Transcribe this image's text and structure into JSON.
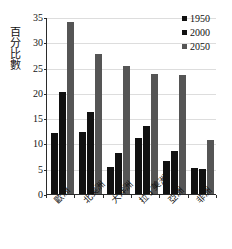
{
  "chart_data": {
    "type": "bar",
    "title": "",
    "xlabel": "",
    "ylabel": "百分比數",
    "ylim": [
      0,
      35
    ],
    "yticks": [
      0,
      5,
      10,
      15,
      20,
      25,
      30,
      35
    ],
    "grid": true,
    "legend_position": "top-right",
    "categories": [
      "歐洲",
      "北美洲",
      "大洋洲",
      "拉丁美洲",
      "亞洲",
      "非洲"
    ],
    "series": [
      {
        "name": "1950",
        "color": "#111111",
        "values": [
          12.0,
          12.3,
          5.4,
          11.1,
          6.6,
          5.2
        ]
      },
      {
        "name": "2000",
        "color": "#111111",
        "values": [
          20.2,
          16.2,
          8.2,
          13.4,
          8.5,
          4.9
        ]
      },
      {
        "name": "2050",
        "color": "#555555",
        "values": [
          34.1,
          27.7,
          25.4,
          23.8,
          23.5,
          10.6
        ]
      }
    ]
  },
  "axis": {
    "y_title": "百分比數",
    "y_tick_labels": [
      "0",
      "5",
      "10",
      "15",
      "20",
      "25",
      "30",
      "35"
    ],
    "x_tick_labels": [
      "歐洲",
      "北美洲",
      "大洋洲",
      "拉丁美洲",
      "亞洲",
      "非洲"
    ]
  },
  "legend": {
    "items": [
      {
        "label": "1950",
        "color": "#111111"
      },
      {
        "label": "2000",
        "color": "#111111"
      },
      {
        "label": "2050",
        "color": "#555555"
      }
    ]
  }
}
